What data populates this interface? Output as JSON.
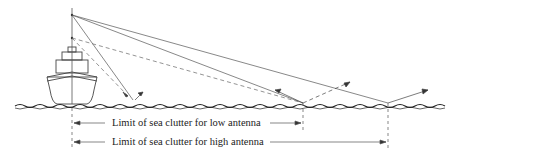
{
  "diagram": {
    "labels": {
      "low": "Limit of sea clutter for low antenna",
      "high": "Limit of sea clutter for high antenna"
    },
    "elements": [
      "ship",
      "mast",
      "high-antenna",
      "low-antenna",
      "sea-surface",
      "radar-beam-rays",
      "reflection-arrows",
      "limit-markers"
    ],
    "colors": {
      "ink": "#333333",
      "background": "#ffffff"
    }
  }
}
